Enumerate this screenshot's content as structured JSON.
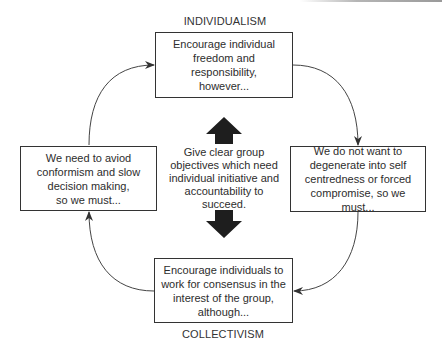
{
  "diagram": {
    "title_top": "INDIVIDUALISM",
    "title_bottom": "COLLECTIVISM",
    "boxes": {
      "top": "Encourage individual\nfreedom and\nresponsibility,\nhowever...",
      "right": "We do not want to\ndegenerate into self\ncentredness or forced\ncompromise, so we must...",
      "bottom": "Encourage individuals to\nwork for consensus in the\ninterest of the group,\nalthough...",
      "left": "We need to aviod\nconformism and slow\ndecision making,\nso we must..."
    },
    "center_text": "Give clear group\nobjectives which need\nindividual initiative and\naccountability to\nsucceed.",
    "colors": {
      "stroke": "#333333",
      "arrow_fill": "#1e1e1e",
      "background": "#ffffff"
    }
  }
}
